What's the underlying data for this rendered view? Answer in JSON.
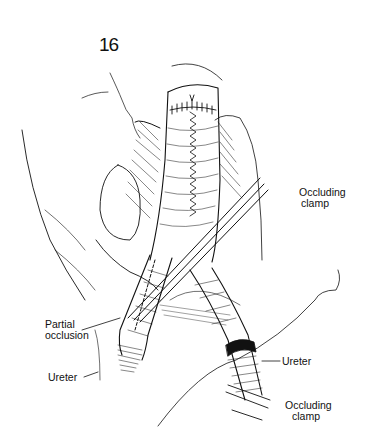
{
  "figure": {
    "number": "16",
    "labels": {
      "occluding_clamp_top": [
        "Occluding",
        "clamp"
      ],
      "partial_occlusion": [
        "Partial",
        "occlusion"
      ],
      "ureter_left": "Ureter",
      "ureter_right": "Ureter",
      "occluding_clamp_bottom": [
        "Occluding",
        "clamp"
      ]
    }
  },
  "colors": {
    "ink": "#111111",
    "paper": "#ffffff"
  }
}
